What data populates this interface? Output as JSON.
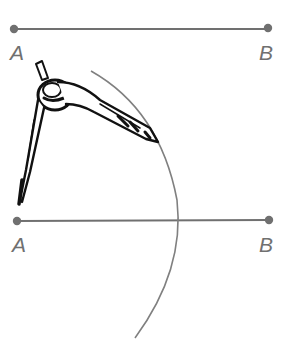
{
  "diagram": {
    "colors": {
      "segment": "#707070",
      "arc": "#808080",
      "compass": "#111111",
      "label": "#707070"
    },
    "top_segment": {
      "label_start": "A",
      "label_end": "B"
    },
    "bottom_segment": {
      "label_start": "A",
      "label_end": "B"
    }
  }
}
